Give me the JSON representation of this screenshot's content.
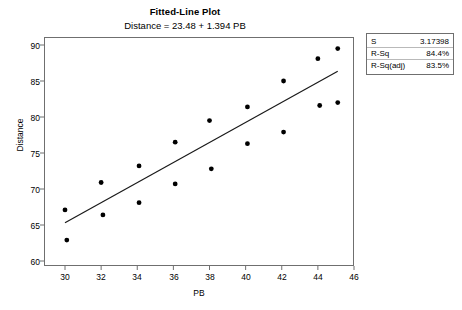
{
  "chart_data": {
    "type": "scatter",
    "title": "Fitted-Line Plot",
    "subtitle": "Distance = 23.48 + 1.394 PB",
    "xlabel": "PB",
    "ylabel": "Distance",
    "xlim": [
      29,
      46
    ],
    "ylim": [
      59,
      91.5
    ],
    "xticks": [
      30,
      32,
      34,
      36,
      38,
      40,
      42,
      44,
      46
    ],
    "yticks": [
      60,
      65,
      70,
      75,
      80,
      85,
      90
    ],
    "grid": false,
    "legend_position": "outside-right-top",
    "points": [
      {
        "x": 30.0,
        "y": 67.1
      },
      {
        "x": 30.1,
        "y": 62.9
      },
      {
        "x": 32.0,
        "y": 70.9
      },
      {
        "x": 32.1,
        "y": 66.4
      },
      {
        "x": 34.1,
        "y": 73.2
      },
      {
        "x": 34.1,
        "y": 68.1
      },
      {
        "x": 36.1,
        "y": 76.5
      },
      {
        "x": 36.1,
        "y": 70.7
      },
      {
        "x": 38.0,
        "y": 79.5
      },
      {
        "x": 38.1,
        "y": 72.8
      },
      {
        "x": 40.1,
        "y": 81.4
      },
      {
        "x": 40.1,
        "y": 76.3
      },
      {
        "x": 42.1,
        "y": 85.0
      },
      {
        "x": 42.1,
        "y": 77.9
      },
      {
        "x": 44.0,
        "y": 88.1
      },
      {
        "x": 44.1,
        "y": 81.6
      },
      {
        "x": 45.1,
        "y": 89.5
      },
      {
        "x": 45.1,
        "y": 82.0
      }
    ],
    "fit_line": {
      "intercept": 23.48,
      "slope": 1.394,
      "x_start": 30.0,
      "x_end": 45.1
    },
    "series_name": "Distance vs PB",
    "marker": "filled-circle",
    "marker_color": "#000000",
    "line_color": "#1a1a1a"
  },
  "stats_box": {
    "rows": [
      {
        "key": "S",
        "value": "3.17398"
      },
      {
        "key": "R-Sq",
        "value": "84.4%"
      },
      {
        "key": "R-Sq(adj)",
        "value": "83.5%"
      }
    ]
  },
  "axis_text": {
    "ytick_0": "60",
    "ytick_1": "65",
    "ytick_2": "70",
    "ytick_3": "75",
    "ytick_4": "80",
    "ytick_5": "85",
    "ytick_6": "90",
    "xtick_0": "30",
    "xtick_1": "32",
    "xtick_2": "34",
    "xtick_3": "36",
    "xtick_4": "38",
    "xtick_5": "40",
    "xtick_6": "42",
    "xtick_7": "44",
    "xtick_8": "46"
  },
  "colors": {
    "frame": "#6f6f6f",
    "marker": "#000000",
    "fit_line": "#1a1a1a",
    "background": "#ffffff"
  }
}
